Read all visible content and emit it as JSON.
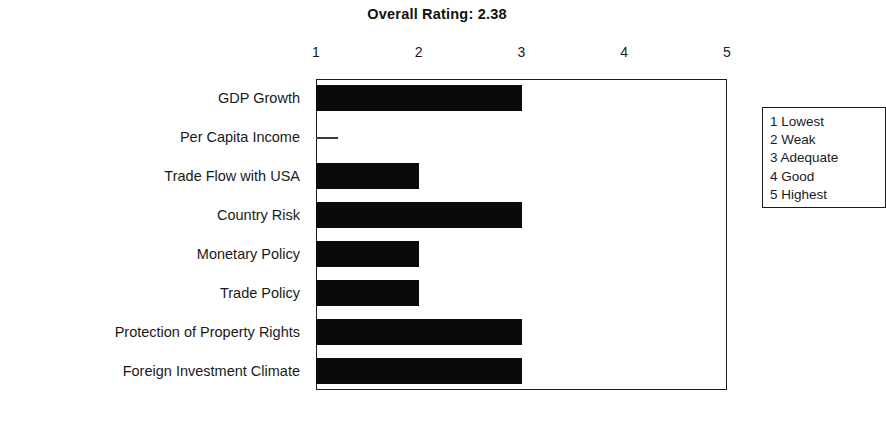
{
  "chart_data": {
    "type": "bar",
    "orientation": "horizontal",
    "title": "Overall Rating:  2.38",
    "xlabel": "",
    "ylabel": "",
    "xlim": [
      1,
      5
    ],
    "xticks": [
      1,
      2,
      3,
      4,
      5
    ],
    "xtick_labels": [
      "1",
      "2",
      "3",
      "4",
      "5"
    ],
    "grid": false,
    "bar_color": "#0a0a0a",
    "overall_rating": "2.38",
    "categories": [
      "GDP Growth",
      "Per Capita Income",
      "Trade Flow with USA",
      "Country Risk",
      "Monetary Policy",
      "Trade Policy",
      "Protection of Property Rights",
      "Foreign Investment Climate"
    ],
    "values": [
      3,
      1,
      2,
      3,
      2,
      2,
      3,
      3
    ],
    "legend_position": "right-outside",
    "legend_title": "",
    "legend_entries": [
      "1 Lowest",
      "2 Weak",
      "3 Adequate",
      "4 Good",
      "5 Highest"
    ]
  }
}
